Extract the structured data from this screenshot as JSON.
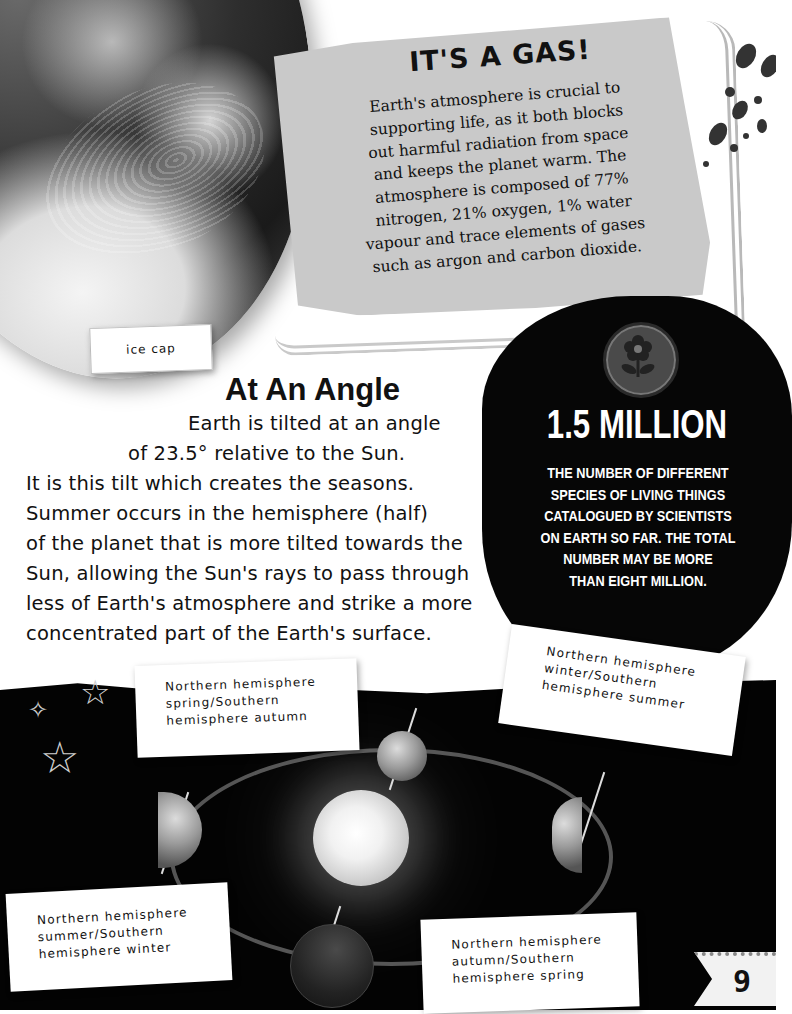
{
  "page_number": "9",
  "gas_box": {
    "title": "IT'S A GAS!",
    "lines": [
      "Earth's atmosphere is crucial to",
      "supporting life, as it both blocks",
      "out harmful radiation from space",
      "and keeps the planet warm. The",
      "atmosphere is composed of 77%",
      "nitrogen, 21% oxygen, 1% water",
      "vapour and trace elements of gases",
      "such as argon and carbon dioxide."
    ]
  },
  "globe": {
    "label": "ice cap"
  },
  "angle_section": {
    "title": "At An Angle",
    "lines": [
      "Earth is tilted at an angle",
      "of 23.5° relative to the Sun.",
      "It is this tilt which creates the seasons.",
      "Summer occurs in the hemisphere (half)",
      "of the planet that is more tilted towards the",
      "Sun, allowing the Sun's rays to pass through",
      "less of Earth's atmosphere and strike a more",
      "concentrated part of the Earth's surface."
    ]
  },
  "stat": {
    "icon": "flower-icon",
    "value": "1.5 MILLION",
    "description_lines": [
      "THE NUMBER OF DIFFERENT",
      "SPECIES OF LIVING THINGS",
      "CATALOGUED BY SCIENTISTS",
      "ON EARTH SO FAR. THE TOTAL",
      "NUMBER MAY BE MORE",
      "THAN EIGHT MILLION."
    ]
  },
  "diagram": {
    "center": "sun",
    "seasons": [
      {
        "position": "top",
        "lines": [
          "Northern hemisphere",
          "spring/Southern",
          "hemisphere autumn"
        ]
      },
      {
        "position": "right",
        "lines": [
          "Northern hemisphere",
          "winter/Southern",
          "hemisphere summer"
        ]
      },
      {
        "position": "left",
        "lines": [
          "Northern hemisphere",
          "summer/Southern",
          "hemisphere winter"
        ]
      },
      {
        "position": "bottom",
        "lines": [
          "Northern hemisphere",
          "autumn/Southern",
          "hemisphere spring"
        ]
      }
    ]
  },
  "colors": {
    "background": "#ffffff",
    "panel_grey": "#c9c9c9",
    "blob_black": "#060606",
    "space_black": "#030303",
    "text": "#111111"
  }
}
